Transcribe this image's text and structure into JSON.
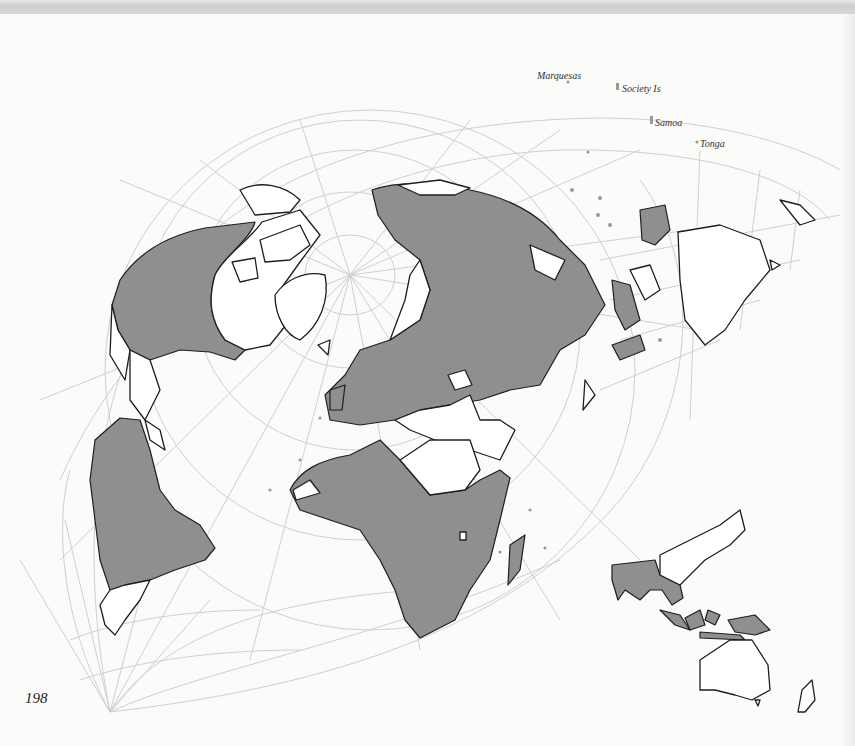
{
  "page": {
    "number": "198",
    "colors": {
      "background": "#fbfbfa",
      "shaded_region": "#8f8f8f",
      "graticule": "#cfcfcf",
      "coastline": "#1e1e1e"
    }
  },
  "labels": {
    "marquesas": "Marquesas",
    "society": "Society Is",
    "samoa": "Samoa",
    "tonga": "Tonga"
  },
  "map": {
    "main": "World map (oblique projection) with shaded regions across the Americas, Europe, Asia and Africa",
    "inset": "Inset map of South/Southeast Asia, Indonesia, Australia and New Zealand with shaded regions"
  }
}
